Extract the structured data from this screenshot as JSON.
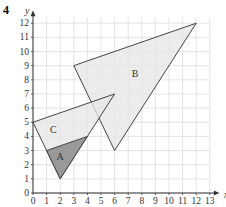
{
  "question_number": "4",
  "axes": {
    "xlabel": "x",
    "ylabel": "y",
    "xticks": [
      "0",
      "1",
      "2",
      "3",
      "4",
      "5",
      "6",
      "7",
      "8",
      "9",
      "10",
      "11",
      "12",
      "13"
    ],
    "yticks": [
      "0",
      "1",
      "2",
      "3",
      "4",
      "5",
      "6",
      "7",
      "8",
      "9",
      "10",
      "11",
      "12"
    ]
  },
  "shapes": [
    {
      "label": "A",
      "vertices": [
        [
          1,
          3
        ],
        [
          4,
          4
        ],
        [
          2,
          1
        ]
      ],
      "fill": "#999999"
    },
    {
      "label": "B",
      "vertices": [
        [
          3,
          9
        ],
        [
          12,
          12
        ],
        [
          6,
          3
        ]
      ],
      "fill": "#e6e6e6"
    },
    {
      "label": "C",
      "vertices": [
        [
          0,
          5
        ],
        [
          6,
          7
        ],
        [
          2,
          1
        ]
      ],
      "fill": "#e6e6e6"
    }
  ],
  "colors": {
    "grid": "#d9d9d9",
    "axis": "#333333",
    "line": "#444444"
  }
}
